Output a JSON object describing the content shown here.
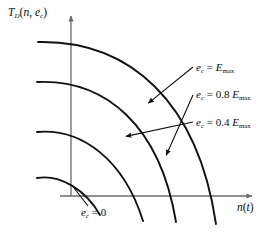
{
  "figure": {
    "background_color": "#ffffff",
    "ink_color": "#0d0d0d",
    "axis_color": "#6b6b6b"
  },
  "axes": {
    "y_label": {
      "base": "T",
      "base_sub": "D",
      "args_open": "(",
      "arg1": "n",
      "comma": ", ",
      "arg2": "e",
      "arg2_sub": "c",
      "args_close": ")",
      "full_text": "T_D(n, e_c)"
    },
    "x_label": {
      "base": "n",
      "open": "(",
      "arg": "t",
      "close": ")",
      "full_text": "n(t)"
    },
    "origin_x": 71,
    "origin_y": 196,
    "x_axis_end": 255,
    "y_axis_top": 14,
    "has_arrows": true,
    "tick_labels": [],
    "grid": false
  },
  "annotations": [
    {
      "id": "emax",
      "lhs": "e",
      "lhs_sub": "c",
      "eq": " = ",
      "coefficient": "",
      "rhs": "E",
      "rhs_sub": "max",
      "full_text": "e_c = E_max",
      "curve_index": 3
    },
    {
      "id": "08emax",
      "lhs": "e",
      "lhs_sub": "c",
      "eq": " = ",
      "coefficient": "0.8 ",
      "rhs": "E",
      "rhs_sub": "max",
      "full_text": "e_c = 0.8 E_max",
      "curve_index": 2
    },
    {
      "id": "04emax",
      "lhs": "e",
      "lhs_sub": "c",
      "eq": " = ",
      "coefficient": "0.4 ",
      "rhs": "E",
      "rhs_sub": "max",
      "full_text": "e_c = 0.4 E_max",
      "curve_index": 1
    },
    {
      "id": "zero",
      "lhs": "e",
      "lhs_sub": "c",
      "eq": " = ",
      "coefficient": "",
      "rhs": "0",
      "rhs_sub": "",
      "full_text": "e_c = 0",
      "curve_index": 0
    }
  ],
  "chart_data": {
    "type": "line",
    "title": "",
    "xlabel": "n(t)",
    "ylabel": "T_D(n, e_c)",
    "grid": false,
    "legend": "inline-annotations",
    "xlim": [
      0,
      1
    ],
    "ylim": [
      0,
      1
    ],
    "series": [
      {
        "name": "e_c = 0",
        "label": "e_c = 0",
        "path": "M 37 178 C 60 174 86 190 100 215",
        "start_point": [
          37,
          178
        ],
        "end_point": [
          100,
          215
        ]
      },
      {
        "name": "e_c = 0.4 E_max",
        "label": "e_c = 0.4 E_max",
        "path": "M 37 132 C 82 128 124 160 143 221",
        "start_point": [
          37,
          132
        ],
        "end_point": [
          143,
          221
        ]
      },
      {
        "name": "e_c = 0.8 E_max",
        "label": "e_c = 0.8 E_max",
        "path": "M 37 82 C 105 79 160 125 176 222",
        "start_point": [
          37,
          82
        ],
        "end_point": [
          176,
          222
        ]
      },
      {
        "name": "e_c = E_max",
        "label": "e_c = E_max",
        "path": "M 38 42 C 130 40 198 102 216 224",
        "start_point": [
          38,
          42
        ],
        "end_point": [
          216,
          224
        ]
      }
    ],
    "leaders": [
      {
        "for": "e_c = E_max",
        "from": [
          193,
          67
        ],
        "to": [
          146,
          105
        ]
      },
      {
        "for": "e_c = 0.8 E_max",
        "from": [
          193,
          95
        ],
        "to": [
          165,
          158
        ]
      },
      {
        "for": "e_c = 0.4 E_max",
        "from": [
          193,
          122
        ],
        "to": [
          123,
          137
        ]
      },
      {
        "for": "e_c = 0",
        "from": [
          88,
          206
        ],
        "to": [
          74,
          188
        ]
      }
    ]
  }
}
